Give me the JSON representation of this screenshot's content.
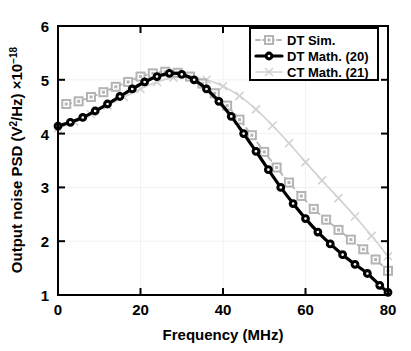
{
  "chart_data": {
    "type": "line",
    "title": "",
    "xlabel": "Frequency (MHz)",
    "ylabel": "Output noise PSD (V2/Hz) ×10-18",
    "ylabel_parts": {
      "main_a": "Output noise PSD (V",
      "sup_a": "2",
      "main_b": "/Hz) ×10",
      "sup_b": "−18"
    },
    "xlim": [
      0,
      80
    ],
    "ylim": [
      1,
      6
    ],
    "xticks": [
      0,
      20,
      40,
      60,
      80
    ],
    "yticks": [
      1,
      2,
      3,
      4,
      5,
      6
    ],
    "xtick_labels": [
      "0",
      "20",
      "40",
      "60",
      "80"
    ],
    "ytick_labels": [
      "1",
      "2",
      "3",
      "4",
      "5",
      "6"
    ],
    "grid": true,
    "legend_position": "top-right",
    "series": [
      {
        "name": "DT Sim.",
        "style": "dashed",
        "color": "#b4b4b4",
        "marker": "square",
        "x": [
          2,
          5,
          8,
          11,
          14,
          17,
          20,
          23,
          26,
          29,
          32,
          35,
          38,
          41,
          44,
          47,
          50,
          53,
          56,
          59,
          62,
          65,
          68,
          71,
          74,
          77,
          80
        ],
        "y": [
          4.55,
          4.6,
          4.68,
          4.77,
          4.87,
          4.96,
          5.06,
          5.12,
          5.15,
          5.13,
          5.06,
          4.93,
          4.75,
          4.52,
          4.26,
          3.97,
          3.66,
          3.37,
          3.09,
          2.84,
          2.6,
          2.4,
          2.21,
          2.03,
          1.85,
          1.66,
          1.45
        ]
      },
      {
        "name": "DT Math. (20)",
        "style": "solid",
        "color": "#000000",
        "marker": "circle",
        "x": [
          0,
          3,
          6,
          9,
          12,
          15,
          18,
          21,
          24,
          27,
          30,
          33,
          36,
          39,
          42,
          45,
          48,
          51,
          54,
          57,
          60,
          63,
          66,
          69,
          72,
          75,
          78,
          80
        ],
        "y": [
          4.14,
          4.21,
          4.3,
          4.42,
          4.55,
          4.69,
          4.83,
          4.96,
          5.06,
          5.12,
          5.1,
          5.0,
          4.83,
          4.6,
          4.32,
          4.0,
          3.67,
          3.33,
          3.0,
          2.7,
          2.42,
          2.17,
          1.95,
          1.75,
          1.57,
          1.4,
          1.18,
          1.05
        ]
      },
      {
        "name": "CT Math. (21)",
        "style": "solid-thin",
        "color": "#d2d2d2",
        "marker": "cross",
        "x": [
          0,
          4,
          8,
          12,
          16,
          20,
          24,
          28,
          32,
          36,
          40,
          44,
          48,
          52,
          56,
          60,
          64,
          68,
          72,
          76,
          80
        ],
        "y": [
          4.1,
          4.22,
          4.36,
          4.52,
          4.68,
          4.83,
          4.96,
          5.04,
          5.05,
          5.0,
          4.88,
          4.7,
          4.45,
          4.15,
          3.82,
          3.47,
          3.13,
          2.8,
          2.46,
          2.1,
          1.72
        ]
      }
    ]
  },
  "legend": {
    "items": [
      {
        "label": "DT Sim."
      },
      {
        "label": "DT Math. (20)"
      },
      {
        "label": "CT Math. (21)"
      }
    ]
  }
}
